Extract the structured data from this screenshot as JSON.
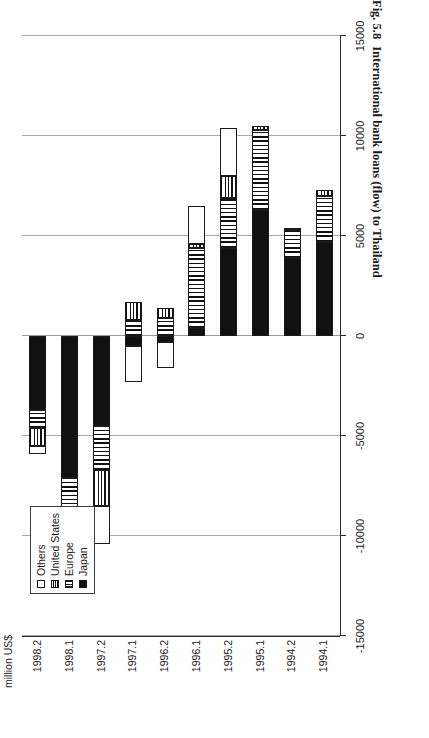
{
  "figure": {
    "caption_number": "Fig. 5.8",
    "caption_text": "International bank loans (flow) to Thailand"
  },
  "axis_title": "million US$",
  "legend": {
    "items": [
      {
        "label": "Others",
        "pattern": "others"
      },
      {
        "label": "United States",
        "pattern": "us"
      },
      {
        "label": "Europe",
        "pattern": "europe"
      },
      {
        "label": "Japan",
        "pattern": "japan"
      }
    ]
  },
  "chart_data": {
    "type": "bar",
    "orientation": "vertical-stacked",
    "title": "International bank loans (flow) to Thailand",
    "xlabel": "",
    "ylabel": "million US$",
    "ylim": [
      -15000,
      15000
    ],
    "ytick_labels": [
      "15000",
      "10000",
      "5000",
      "0",
      "-5000",
      "-10000",
      "-15000"
    ],
    "ytick_values": [
      15000,
      10000,
      5000,
      0,
      -5000,
      -10000,
      -15000
    ],
    "grid": true,
    "legend_position": "top-left",
    "categories": [
      "1994.1",
      "1994.2",
      "1995.1",
      "1995.2",
      "1996.1",
      "1996.2",
      "1997.1",
      "1997.2",
      "1998.1",
      "1998.2"
    ],
    "series": [
      {
        "name": "Japan",
        "pattern": "japan",
        "values": [
          4700,
          3900,
          6300,
          4400,
          400,
          -300,
          -500,
          -4500,
          -7100,
          -3700
        ]
      },
      {
        "name": "Europe",
        "pattern": "europe",
        "values": [
          2300,
          1400,
          4000,
          2500,
          4000,
          900,
          800,
          -2200,
          -2000,
          -900
        ]
      },
      {
        "name": "United States",
        "pattern": "us",
        "values": [
          300,
          100,
          200,
          1100,
          200,
          500,
          900,
          -1800,
          -800,
          -900
        ]
      },
      {
        "name": "Others",
        "pattern": "others",
        "values": [
          0,
          0,
          0,
          2400,
          1900,
          -1300,
          -1800,
          -1900,
          -2000,
          -400
        ]
      }
    ]
  }
}
